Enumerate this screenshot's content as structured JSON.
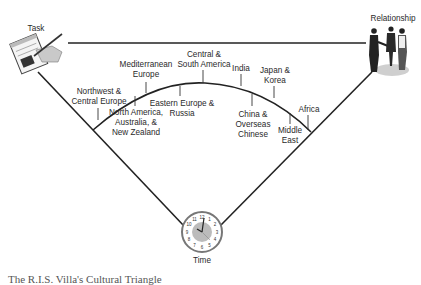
{
  "diagram": {
    "corners": {
      "task": {
        "label": "Task",
        "icon": "handwriting-on-notepad-icon"
      },
      "relationship": {
        "label": "Relationship",
        "icon": "people-shaking-hands-icon"
      },
      "time": {
        "label": "Time",
        "icon": "clock-icon"
      }
    },
    "regions": [
      {
        "id": "northwest-central-europe",
        "lines": [
          "Northwest &",
          "Central Europe"
        ]
      },
      {
        "id": "north-america-australia-nz",
        "lines": [
          "North America,",
          "Australia, &",
          "New Zealand"
        ]
      },
      {
        "id": "mediterranean-europe",
        "lines": [
          "Mediterranean",
          "Europe"
        ]
      },
      {
        "id": "eastern-europe-russia",
        "lines": [
          "Eastern Europe &",
          "Russia"
        ]
      },
      {
        "id": "central-south-america",
        "lines": [
          "Central &",
          "South America"
        ]
      },
      {
        "id": "india",
        "lines": [
          "India"
        ]
      },
      {
        "id": "china-overseas-chinese",
        "lines": [
          "China &",
          "Overseas",
          "Chinese"
        ]
      },
      {
        "id": "japan-korea",
        "lines": [
          "Japan &",
          "Korea"
        ]
      },
      {
        "id": "middle-east",
        "lines": [
          "Middle",
          "East"
        ]
      },
      {
        "id": "africa",
        "lines": [
          "Africa"
        ]
      }
    ],
    "clock_numbers": [
      "12",
      "1",
      "2",
      "3",
      "4",
      "5",
      "6",
      "7",
      "8",
      "9",
      "10",
      "11"
    ],
    "caption_partial": "The R.I.S. Villa's Cultural Triangle"
  }
}
